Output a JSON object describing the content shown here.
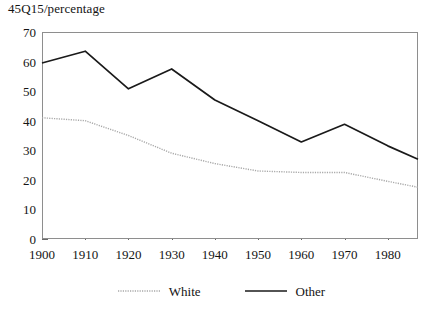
{
  "chart_data": {
    "type": "line",
    "title": "45Q15/percentage",
    "xlabel": "",
    "ylabel": "",
    "xlim": [
      1900,
      1987
    ],
    "ylim": [
      0,
      70
    ],
    "grid": false,
    "legend_position": "bottom-center",
    "x": [
      1900,
      1910,
      1920,
      1930,
      1940,
      1950,
      1960,
      1970,
      1980,
      1987
    ],
    "xticks": [
      1900,
      1910,
      1920,
      1930,
      1940,
      1950,
      1960,
      1970,
      1980
    ],
    "xtick_labels": [
      "1900",
      "1910",
      "1920",
      "1930",
      "1940",
      "1950",
      "1960",
      "1970",
      "1980"
    ],
    "yticks": [
      0,
      10,
      20,
      30,
      40,
      50,
      60,
      70
    ],
    "ytick_labels": [
      "0",
      "10",
      "20",
      "30",
      "40",
      "50",
      "60",
      "70"
    ],
    "series": [
      {
        "name": "White",
        "style": "dotted",
        "color": "#a8a8a8",
        "values": [
          41.0,
          40.0,
          35.0,
          29.0,
          25.5,
          23.0,
          22.5,
          22.5,
          19.5,
          17.5
        ]
      },
      {
        "name": "Other",
        "style": "solid",
        "color": "#1a1a1a",
        "values": [
          59.5,
          63.5,
          50.8,
          57.5,
          47.0,
          40.0,
          32.8,
          38.8,
          31.5,
          27.0
        ]
      }
    ]
  },
  "legend": {
    "entries": [
      {
        "label": "White",
        "swatch": "dotted-line-swatch"
      },
      {
        "label": "Other",
        "swatch": "solid-line-swatch"
      }
    ]
  }
}
